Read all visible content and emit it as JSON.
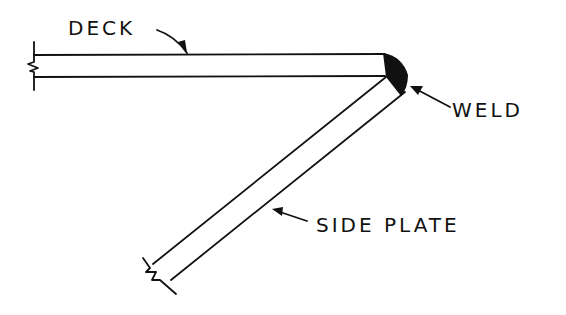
{
  "diagram": {
    "labels": {
      "deck": "DECK",
      "weld": "WELD",
      "side_plate": "SIDE PLATE"
    },
    "colors": {
      "ink": "#111111",
      "background": "#ffffff"
    }
  }
}
